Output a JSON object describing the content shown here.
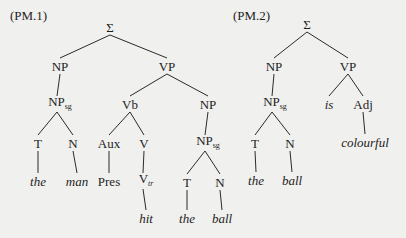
{
  "trees": [
    {
      "label": "(PM.1)",
      "label_pos": [
        10,
        9
      ],
      "nodes": [
        {
          "id": "s",
          "text": "Σ",
          "x": 110,
          "y": 27
        },
        {
          "id": "np",
          "text": "NP",
          "x": 60,
          "y": 66
        },
        {
          "id": "vp",
          "text": "VP",
          "x": 167,
          "y": 66
        },
        {
          "id": "npsg",
          "text": "NP",
          "sub": "sg",
          "x": 60,
          "y": 104
        },
        {
          "id": "vb",
          "text": "Vb",
          "x": 130,
          "y": 104
        },
        {
          "id": "np2",
          "text": "NP",
          "x": 208,
          "y": 104
        },
        {
          "id": "t",
          "text": "T",
          "x": 38,
          "y": 143
        },
        {
          "id": "n",
          "text": "N",
          "x": 73,
          "y": 143
        },
        {
          "id": "aux",
          "text": "Aux",
          "x": 109,
          "y": 143
        },
        {
          "id": "v",
          "text": "V",
          "x": 144,
          "y": 143
        },
        {
          "id": "npsg2",
          "text": "NP",
          "sub": "sg",
          "x": 208,
          "y": 143
        },
        {
          "id": "the",
          "text": "the",
          "italic": true,
          "x": 38,
          "y": 181
        },
        {
          "id": "man",
          "text": "man",
          "italic": true,
          "x": 77,
          "y": 181
        },
        {
          "id": "pres",
          "text": "Pres",
          "x": 109,
          "y": 181
        },
        {
          "id": "vtr",
          "text": "V",
          "sub": "tr",
          "x": 146,
          "y": 181
        },
        {
          "id": "t2",
          "text": "T",
          "x": 187,
          "y": 182
        },
        {
          "id": "n2",
          "text": "N",
          "x": 220,
          "y": 182
        },
        {
          "id": "hit",
          "text": "hit",
          "italic": true,
          "x": 146,
          "y": 218
        },
        {
          "id": "the2",
          "text": "the",
          "italic": true,
          "x": 187,
          "y": 218
        },
        {
          "id": "ball",
          "text": "ball",
          "italic": true,
          "x": 222,
          "y": 218
        }
      ],
      "edges": [
        [
          "s",
          "np"
        ],
        [
          "s",
          "vp"
        ],
        [
          "np",
          "npsg"
        ],
        [
          "vp",
          "vb"
        ],
        [
          "vp",
          "np2"
        ],
        [
          "npsg",
          "t"
        ],
        [
          "npsg",
          "n"
        ],
        [
          "vb",
          "aux"
        ],
        [
          "vb",
          "v"
        ],
        [
          "np2",
          "npsg2"
        ],
        [
          "t",
          "the"
        ],
        [
          "n",
          "man"
        ],
        [
          "aux",
          "pres"
        ],
        [
          "v",
          "vtr"
        ],
        [
          "npsg2",
          "t2"
        ],
        [
          "npsg2",
          "n2"
        ],
        [
          "vtr",
          "hit"
        ],
        [
          "t2",
          "the2"
        ],
        [
          "n2",
          "ball"
        ]
      ]
    },
    {
      "label": "(PM.2)",
      "label_pos": [
        233,
        9
      ],
      "nodes": [
        {
          "id": "s",
          "text": "Σ",
          "x": 307,
          "y": 24
        },
        {
          "id": "np",
          "text": "NP",
          "x": 274,
          "y": 66
        },
        {
          "id": "vp",
          "text": "VP",
          "x": 348,
          "y": 66
        },
        {
          "id": "npsg",
          "text": "NP",
          "sub": "sg",
          "x": 275,
          "y": 104
        },
        {
          "id": "is",
          "text": "is",
          "italic": true,
          "x": 329,
          "y": 104
        },
        {
          "id": "adj",
          "text": "Adj",
          "x": 363,
          "y": 104
        },
        {
          "id": "t",
          "text": "T",
          "x": 255,
          "y": 143
        },
        {
          "id": "n",
          "text": "N",
          "x": 290,
          "y": 143
        },
        {
          "id": "colourful",
          "text": "colourful",
          "italic": true,
          "x": 365,
          "y": 142
        },
        {
          "id": "the",
          "text": "the",
          "italic": true,
          "x": 256,
          "y": 180
        },
        {
          "id": "ball",
          "text": "ball",
          "italic": true,
          "x": 292,
          "y": 180
        }
      ],
      "edges": [
        [
          "s",
          "np"
        ],
        [
          "s",
          "vp"
        ],
        [
          "np",
          "npsg"
        ],
        [
          "vp",
          "is"
        ],
        [
          "vp",
          "adj"
        ],
        [
          "npsg",
          "t"
        ],
        [
          "npsg",
          "n"
        ],
        [
          "adj",
          "colourful"
        ],
        [
          "t",
          "the"
        ],
        [
          "n",
          "ball"
        ]
      ]
    }
  ]
}
